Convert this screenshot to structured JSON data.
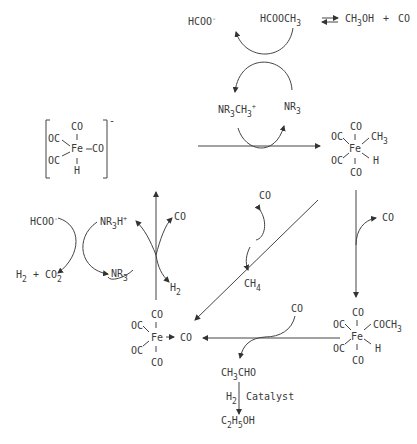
{
  "top": {
    "formate": "HCOO",
    "formate_charge": "-",
    "methyl_formate": "HCOOCH",
    "methyl_formate_sub": "3",
    "methanol": "CH",
    "methanol_sub": "3",
    "methanol_tail": "OH",
    "plus": "+",
    "co": "CO"
  },
  "amine_cycle_top": {
    "methylammonium": "NR",
    "methylammonium_sub1": "3",
    "methylammonium_mid": "CH",
    "methylammonium_sub2": "3",
    "methylammonium_charge": "+",
    "amine": "NR",
    "amine_sub": "3"
  },
  "hydride_anion": {
    "co_top": "CO",
    "oc_upper": "OC",
    "oc_lower": "OC",
    "fe": "Fe",
    "co_right": "CO",
    "h": "H",
    "charge": "-"
  },
  "methyl_hydride": {
    "co_top": "CO",
    "oc_upper": "OC",
    "oc_lower": "OC",
    "fe": "Fe",
    "ch3": "CH",
    "ch3_sub": "3",
    "h": "H",
    "co_bottom": "CO"
  },
  "acyl_hydride": {
    "co_top": "CO",
    "oc_upper": "OC",
    "oc_lower": "OC",
    "fe": "Fe",
    "coch3": "COCH",
    "coch3_sub": "3",
    "h": "H",
    "co_bottom": "CO"
  },
  "fe_pentacarbonyl": {
    "co_top": "CO",
    "oc_upper": "OC",
    "oc_lower": "OC",
    "fe": "Fe",
    "co_right": "CO",
    "co_bottom": "CO"
  },
  "left_cycle": {
    "formate": "HCOO",
    "formate_charge": "-",
    "h2": "H",
    "h2_sub": "2",
    "plus": "+",
    "co2": "CO",
    "co2_sub": "2",
    "ammonium": "NR",
    "ammonium_sub": "3",
    "ammonium_h": "H",
    "ammonium_charge": "+",
    "amine": "NR",
    "amine_sub": "3",
    "co_out": "CO",
    "h2_out": "H",
    "h2_out_sub": "2"
  },
  "methane_branch": {
    "co_in": "CO",
    "ch4": "CH",
    "ch4_sub": "4"
  },
  "right_branch": {
    "co_in": "CO"
  },
  "bottom_branch": {
    "co_in": "CO",
    "acetaldehyde": "CH",
    "acetaldehyde_sub": "3",
    "acetaldehyde_tail": "CHO",
    "h2": "H",
    "h2_sub": "2",
    "catalyst": "Catalyst",
    "ethanol_c": "C",
    "ethanol_c_sub": "2",
    "ethanol_h": "H",
    "ethanol_h_sub": "5",
    "ethanol_tail": "OH"
  }
}
